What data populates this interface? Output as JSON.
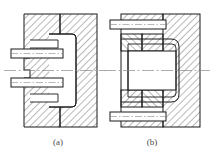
{
  "figure": {
    "kind": "engineering-cross-section",
    "background_color": "#ffffff",
    "line_color": "#1a1a1a",
    "hatch_color": "#333333",
    "centerline_color": "#8a8a8a",
    "caption_color": "#4a4a4a",
    "panels": [
      {
        "id": "a",
        "caption": "(a)",
        "description": "Cavity plate with two horizontal core pins entering from the left; radiused cavity pocket outlined inside the hatched block",
        "features": [
          "hatched-plate-left",
          "hatched-plate-right",
          "horizontal-core-pin-upper",
          "horizontal-core-pin-lower",
          "stepped-notch-upper",
          "stepped-notch-lower",
          "rounded-cavity-outline",
          "horizontal-centerline"
        ]
      },
      {
        "id": "b",
        "caption": "(b)",
        "description": "Large central cavity between split hatched inserts with two angled-hatch wedge blocks and two horizontal core pins at top and bottom",
        "features": [
          "hatched-plate-right",
          "central-cavity-block",
          "wedge-hatch-upper",
          "wedge-hatch-lower",
          "horizontal-core-pin-top",
          "horizontal-core-pin-bottom",
          "rounded-cavity-outline",
          "horizontal-centerline"
        ]
      }
    ]
  }
}
